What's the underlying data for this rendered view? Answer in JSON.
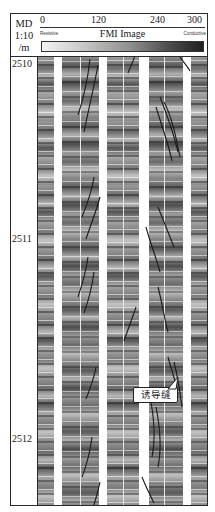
{
  "header": {
    "depth_column": {
      "line1": "MD",
      "line2": "1:10",
      "line3": "/m"
    },
    "image_track": {
      "title": "FMI Image",
      "scale_ticks": [
        {
          "label": "0",
          "position": 0
        },
        {
          "label": "120",
          "position": 120
        },
        {
          "label": "240",
          "position": 240
        },
        {
          "label": "300",
          "position": 300
        }
      ],
      "scale_min": 0,
      "scale_max": 300,
      "left_label": "Resistive",
      "right_label": "Conductive",
      "colorbar": {
        "start_color": "#f4f4f4",
        "end_color": "#202020"
      }
    }
  },
  "depth_labels": [
    {
      "label": "2510",
      "value": 2510
    },
    {
      "label": "2511",
      "value": 2511
    },
    {
      "label": "2512",
      "value": 2512
    }
  ],
  "annotation": {
    "text": "诱导缝"
  },
  "colors": {
    "frame": "#2a2a2a",
    "pad_gap": "#ffffff",
    "fracture": "#1a1a1a"
  }
}
